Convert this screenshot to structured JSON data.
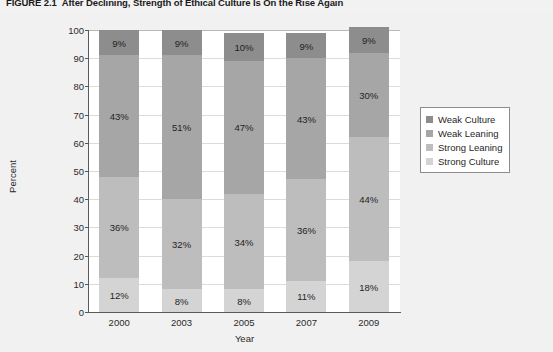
{
  "figure": {
    "number": "FIGURE 2.1",
    "title": "After Declining, Strength of Ethical Culture Is On the Rise Again"
  },
  "chart_data": {
    "type": "bar",
    "stacked": true,
    "title": "After Declining, Strength of Ethical Culture Is On the Rise Again",
    "xlabel": "Year",
    "ylabel": "Percent",
    "ylim": [
      0,
      100
    ],
    "yticks": [
      0,
      10,
      20,
      30,
      40,
      50,
      60,
      70,
      80,
      90,
      100
    ],
    "ytick_labels": [
      "0",
      "10",
      "20",
      "30",
      "40",
      "50",
      "60",
      "70",
      "80",
      "90",
      "100"
    ],
    "grid": true,
    "legend_position": "right",
    "categories": [
      "2000",
      "2003",
      "2005",
      "2007",
      "2009"
    ],
    "series": [
      {
        "name": "Weak Culture",
        "color": "#8d8d8d",
        "values": [
          9,
          9,
          10,
          9,
          9
        ],
        "labels": [
          "9%",
          "9%",
          "10%",
          "9%",
          "9%"
        ]
      },
      {
        "name": "Weak Leaning",
        "color": "#a6a6a6",
        "values": [
          43,
          51,
          47,
          43,
          30
        ],
        "labels": [
          "43%",
          "51%",
          "47%",
          "43%",
          "30%"
        ]
      },
      {
        "name": "Strong Leaning",
        "color": "#bdbdbd",
        "values": [
          36,
          32,
          34,
          36,
          44
        ],
        "labels": [
          "36%",
          "32%",
          "34%",
          "36%",
          "44%"
        ]
      },
      {
        "name": "Strong Culture",
        "color": "#d4d4d4",
        "values": [
          12,
          8,
          8,
          11,
          18
        ],
        "labels": [
          "12%",
          "8%",
          "8%",
          "11%",
          "18%"
        ]
      }
    ]
  },
  "colors": {
    "page_background": "#f2f2f2",
    "plot_background": "#ffffff",
    "gridline": "#dcdcdc",
    "axis": "#5a5a5a",
    "text": "#2b2b2b"
  }
}
